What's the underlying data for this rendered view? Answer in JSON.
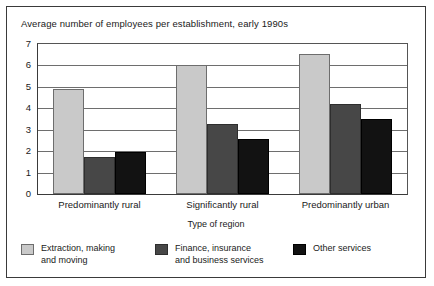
{
  "chart_data": {
    "type": "bar",
    "title": "Average number of employees per establishment, early 1990s",
    "xlabel": "Type of region",
    "ylabel": "",
    "ylim": [
      0,
      7
    ],
    "yticks": [
      "0",
      "1",
      "2",
      "3",
      "4",
      "5",
      "6",
      "7"
    ],
    "grid": true,
    "legend_position": "bottom",
    "categories": [
      "Predominantly rural",
      "Significantly rural",
      "Predominantly urban"
    ],
    "series": [
      {
        "name": "Extraction, making\nand moving",
        "color": "#c9c9c9",
        "values": [
          4.9,
          6.0,
          6.55
        ]
      },
      {
        "name": "Finance, insurance\nand business services",
        "color": "#474747",
        "values": [
          1.75,
          3.25,
          4.2
        ]
      },
      {
        "name": "Other services",
        "color": "#121212",
        "values": [
          1.95,
          2.55,
          3.5
        ]
      }
    ]
  },
  "figure": {
    "border_color": "#3a3a3a",
    "background": "#ffffff"
  }
}
